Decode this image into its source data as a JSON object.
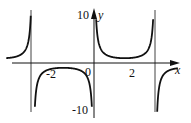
{
  "chart_data": {
    "type": "line",
    "title": "",
    "function": "y = 1/sin(x)",
    "xlabel": "x",
    "ylabel": "y",
    "x_ticks": [
      {
        "value": -2,
        "label": "-2"
      },
      {
        "value": 0,
        "label": "0"
      },
      {
        "value": 2,
        "label": "2"
      }
    ],
    "y_ticks": [
      {
        "value": 10,
        "label": "10"
      },
      {
        "value": -10,
        "label": "-10"
      }
    ],
    "xlim": [
      -4.5,
      4.3
    ],
    "ylim": [
      -11,
      11
    ],
    "asymptotes_x": [
      -3.1416,
      0,
      3.1416
    ],
    "grid": false,
    "legend": null,
    "series": [
      {
        "name": "csc(x)",
        "color": "#111111"
      }
    ]
  },
  "axes": {
    "x_label": "x",
    "y_label": "y",
    "origin_label": "0"
  },
  "ticks": {
    "xm2": "-2",
    "x2": "2",
    "y10": "10",
    "ym10": "-10"
  }
}
